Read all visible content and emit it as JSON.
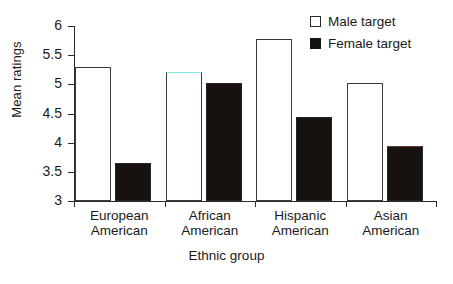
{
  "chart_data": {
    "type": "bar",
    "title": "",
    "xlabel": "Ethnic group",
    "ylabel": "Mean ratings",
    "categories": [
      "European\nAmerican",
      "African\nAmerican",
      "Hispanic\nAmerican",
      "Asian\nAmerican"
    ],
    "category_lines": [
      [
        "European",
        "American"
      ],
      [
        "African",
        "American"
      ],
      [
        "Hispanic",
        "American"
      ],
      [
        "Asian",
        "American"
      ]
    ],
    "series": [
      {
        "name": "Male target",
        "values": [
          5.29,
          5.22,
          5.78,
          5.02
        ],
        "color": "#ffffff",
        "edge_color": "#3a3a3a"
      },
      {
        "name": "Female target",
        "values": [
          3.65,
          5.03,
          4.44,
          3.94
        ],
        "color": "#161210",
        "edge_color": "#161210"
      }
    ],
    "ylim": [
      3,
      6
    ],
    "yticks": [
      3,
      3.5,
      4,
      4.5,
      5,
      5.5,
      6
    ],
    "ytick_labels": [
      "3",
      "3.5",
      "4",
      "4.5",
      "5",
      "5.5",
      "6"
    ],
    "grid": false,
    "legend_position": "top-right"
  },
  "legend": {
    "items": [
      {
        "label": "Male target",
        "marker": "open-square"
      },
      {
        "label": "Female target",
        "marker": "filled-square"
      }
    ]
  },
  "axes": {
    "y_title": "Mean ratings",
    "x_title": "Ethnic group"
  }
}
